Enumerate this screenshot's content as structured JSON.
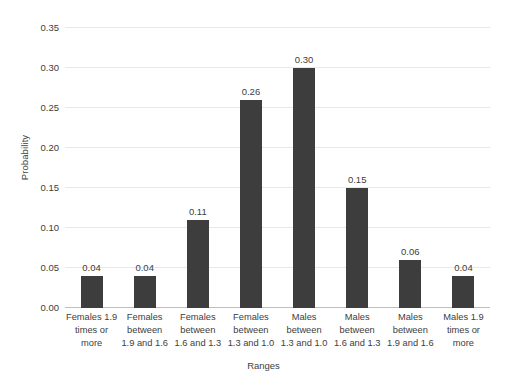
{
  "chart_data": {
    "type": "bar",
    "title": "",
    "xlabel": "Ranges",
    "ylabel": "Probability",
    "ylim": [
      0.0,
      0.35
    ],
    "ytick_step": 0.05,
    "grid": true,
    "legend": "none",
    "bar_color": "#3d3d3d",
    "gridline_color": "#e8e8e8",
    "axis_color": "#bfbfbf",
    "background_color": "#ffffff",
    "categories": [
      "Females 1.9 times or more",
      "Females between 1.9 and 1.6",
      "Females between 1.6 and 1.3",
      "Females between 1.3 and 1.0",
      "Males between 1.3 and 1.0",
      "Males between 1.6 and 1.3",
      "Males between 1.9 and 1.6",
      "Males 1.9 times or more"
    ],
    "category_lines": [
      [
        "Females 1.9",
        "times or",
        "more"
      ],
      [
        "Females",
        "between",
        "1.9 and 1.6"
      ],
      [
        "Females",
        "between",
        "1.6 and 1.3"
      ],
      [
        "Females",
        "between",
        "1.3 and 1.0"
      ],
      [
        "Males",
        "between",
        "1.3 and 1.0"
      ],
      [
        "Males",
        "between",
        "1.6 and 1.3"
      ],
      [
        "Males",
        "between",
        "1.9 and 1.6"
      ],
      [
        "Males 1.9",
        "times or",
        "more"
      ]
    ],
    "values": [
      0.04,
      0.04,
      0.11,
      0.26,
      0.3,
      0.15,
      0.06,
      0.04
    ],
    "value_labels": [
      "0.04",
      "0.04",
      "0.11",
      "0.26",
      "0.30",
      "0.15",
      "0.06",
      "0.04"
    ],
    "ytick_labels": [
      "0.00",
      "0.05",
      "0.10",
      "0.15",
      "0.20",
      "0.25",
      "0.30",
      "0.35"
    ],
    "ytick_values": [
      0.0,
      0.05,
      0.1,
      0.15,
      0.2,
      0.25,
      0.3,
      0.35
    ]
  }
}
